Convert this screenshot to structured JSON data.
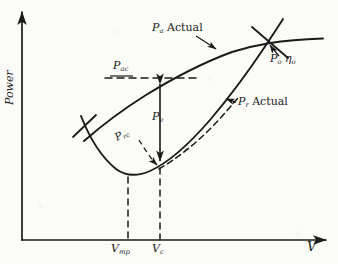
{
  "figure": {
    "kind": "hand-drawn engineering chart",
    "ink_color": "#1a1a1a",
    "paper_color": "#fbfbf8"
  },
  "axes": {
    "x_label": "V",
    "y_label": "Power",
    "x_ticks": [
      "V",
      "V"
    ],
    "x_tick_labels": [
      {
        "base": "V",
        "sub": "mp"
      },
      {
        "base": "V",
        "sub": "c"
      }
    ]
  },
  "annotations": {
    "pa_actual": {
      "base": "P",
      "sub": "a",
      "text": " Actual"
    },
    "pr_actual": {
      "base": "P",
      "sub": "r",
      "text": " Actual"
    },
    "po_etao": {
      "base": "P",
      "sub": "o",
      "eta": "η",
      "eta_sub": "o"
    },
    "pac": {
      "base": "P",
      "sub": "ac"
    },
    "pe": {
      "base": "P",
      "sub": "e"
    },
    "prc": {
      "base": "P",
      "sub": "rc"
    }
  },
  "chart_data": {
    "type": "line",
    "title": "",
    "xlabel": "V",
    "ylabel": "Power",
    "xlim": [
      0,
      338
    ],
    "ylim": [
      0,
      264
    ],
    "grid": false,
    "legend": "none",
    "series": [
      {
        "name": "Pa Actual",
        "style": "solid",
        "description": "power available curve rising from lower-left to upper-right, flattening near the top",
        "points": [
          [
            85,
            140
          ],
          [
            110,
            120
          ],
          [
            140,
            100
          ],
          [
            170,
            82
          ],
          [
            200,
            66
          ],
          [
            230,
            54
          ],
          [
            258,
            46
          ],
          [
            270,
            43
          ],
          [
            290,
            40
          ],
          [
            310,
            39
          ],
          [
            322,
            39
          ]
        ]
      },
      {
        "name": "Pr Actual",
        "style": "solid",
        "description": "power required bucket curve: falls to a minimum then rises steeply to the right",
        "points": [
          [
            82,
            118
          ],
          [
            92,
            140
          ],
          [
            104,
            158
          ],
          [
            116,
            170
          ],
          [
            128,
            175
          ],
          [
            142,
            174
          ],
          [
            156,
            168
          ],
          [
            172,
            156
          ],
          [
            190,
            140
          ],
          [
            208,
            122
          ],
          [
            226,
            102
          ],
          [
            244,
            80
          ],
          [
            258,
            60
          ],
          [
            268,
            46
          ],
          [
            276,
            32
          ],
          [
            282,
            22
          ]
        ]
      },
      {
        "name": "ideal Pr (dashed)",
        "style": "dashed",
        "description": "dashed auxiliary curve running just right of and below the solid Pr curve",
        "points": [
          [
            160,
            168
          ],
          [
            176,
            158
          ],
          [
            192,
            146
          ],
          [
            206,
            134
          ],
          [
            218,
            122
          ],
          [
            228,
            110
          ],
          [
            236,
            100
          ]
        ]
      }
    ],
    "markers": [
      {
        "name": "Po-eta-o intersection",
        "x": 270,
        "y": 43,
        "glyph": "x-cross"
      },
      {
        "name": "left crossing of curves",
        "x": 85,
        "y": 126,
        "glyph": "x-cross"
      },
      {
        "name": "Pac point on Pa curve",
        "x": 160,
        "y": 78
      },
      {
        "name": "Vc point on Pr curve",
        "x": 160,
        "y": 166
      },
      {
        "name": "Vmp minimum of Pr curve",
        "x": 128,
        "y": 176
      }
    ],
    "guides": [
      {
        "name": "Pac horizontal dashed line",
        "style": "dashed",
        "from": [
          105,
          78
        ],
        "to": [
          196,
          78
        ]
      },
      {
        "name": "Vmp vertical dashed line",
        "style": "dashed",
        "from": [
          128,
          176
        ],
        "to": [
          128,
          240
        ]
      },
      {
        "name": "Vc vertical dashed line",
        "style": "dashed",
        "from": [
          160,
          166
        ],
        "to": [
          160,
          240
        ]
      },
      {
        "name": "Pe excess power double arrow",
        "style": "solid-double-arrow",
        "from": [
          160,
          80
        ],
        "to": [
          160,
          164
        ]
      }
    ]
  }
}
